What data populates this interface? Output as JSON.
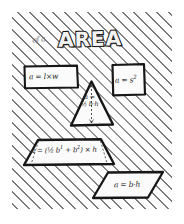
{
  "sheet": {
    "background_style": "diagonal-hatching",
    "ink_color": "#1a1a1a",
    "paper_color": "#fdfdfd"
  },
  "title": {
    "text": "AREA",
    "annotation": "of a"
  },
  "figures": [
    {
      "id": "rectangle",
      "shape_name": "rectangle",
      "formula": "a = l×w",
      "label": "rectangle-figure"
    },
    {
      "id": "square",
      "shape_name": "square",
      "formula_base": "a = s",
      "formula_exponent": "2",
      "label": "square-figure"
    },
    {
      "id": "triangle",
      "shape_name": "triangle",
      "formula_line1": "a =",
      "formula_line2": "½ b·h",
      "label": "triangle-figure",
      "has_height_line": true
    },
    {
      "id": "trapezoid",
      "shape_name": "trapezoid",
      "formula_base": "a = (½ b",
      "formula_sup1": "1",
      "formula_mid": " + b",
      "formula_sup2": "2",
      "formula_tail": ") × h",
      "label": "trapezoid-figure",
      "has_height_line": true
    },
    {
      "id": "parallelogram",
      "shape_name": "parallelogram",
      "formula": "a = b·h",
      "label": "parallelogram-figure"
    }
  ]
}
